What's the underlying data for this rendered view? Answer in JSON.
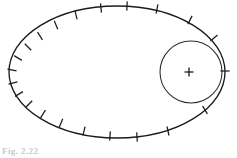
{
  "figure": {
    "background_color": "#ffffff",
    "stroke_color": "#1c1c1c",
    "caption_remnant": "Fig. 2.22",
    "width": 237,
    "height": 158
  },
  "chart_data": {
    "type": "scatter",
    "subtitle": "",
    "xlabel": "",
    "ylabel": "",
    "xlim": [
      0,
      237
    ],
    "ylim": [
      0,
      158
    ],
    "grid": false,
    "legend": "none",
    "annotations": [],
    "shapes": [
      {
        "name": "orbit-ellipse",
        "type": "ellipse",
        "cx": 117,
        "cy": 72,
        "rx": 108,
        "ry": 66,
        "stroke": "#1c1c1c",
        "stroke_width": 1.35,
        "fill": "none"
      },
      {
        "name": "inner-circle",
        "type": "circle",
        "cx": 191,
        "cy": 72,
        "r": 31,
        "stroke": "#2b2b2b",
        "stroke_width": 1.05,
        "fill": "none"
      }
    ],
    "center_markers": [
      {
        "name": "inner-circle-center",
        "x": 189,
        "y": 72,
        "size": 9
      }
    ],
    "series": [
      {
        "name": "position-ticks",
        "marker": "tick",
        "description": "Short cross strokes normal to the ellipse marking successive positions at equal time intervals; crowded near the far (left) side, sparse near the near (right) side.",
        "count": 22,
        "points": [
          {
            "index": 1,
            "x": 225,
            "y": 71,
            "angle_deg": 0
          },
          {
            "index": 2,
            "x": 214,
            "y": 38,
            "angle_deg": 27
          },
          {
            "index": 3,
            "x": 190,
            "y": 20,
            "angle_deg": 50
          },
          {
            "index": 4,
            "x": 157,
            "y": 9,
            "angle_deg": 72
          },
          {
            "index": 5,
            "x": 127,
            "y": 6,
            "angle_deg": 86
          },
          {
            "index": 6,
            "x": 101,
            "y": 8,
            "angle_deg": 99
          },
          {
            "index": 7,
            "x": 76,
            "y": 15,
            "angle_deg": 112
          },
          {
            "index": 8,
            "x": 56,
            "y": 25,
            "angle_deg": 124
          },
          {
            "index": 9,
            "x": 40,
            "y": 36,
            "angle_deg": 136
          },
          {
            "index": 10,
            "x": 28,
            "y": 47,
            "angle_deg": 148
          },
          {
            "index": 11,
            "x": 18,
            "y": 58,
            "angle_deg": 160
          },
          {
            "index": 12,
            "x": 12,
            "y": 70,
            "angle_deg": 174
          },
          {
            "index": 13,
            "x": 13,
            "y": 83,
            "angle_deg": 188
          },
          {
            "index": 14,
            "x": 19,
            "y": 94,
            "angle_deg": 200
          },
          {
            "index": 15,
            "x": 29,
            "y": 104,
            "angle_deg": 212
          },
          {
            "index": 16,
            "x": 43,
            "y": 114,
            "angle_deg": 224
          },
          {
            "index": 17,
            "x": 61,
            "y": 123,
            "angle_deg": 236
          },
          {
            "index": 18,
            "x": 84,
            "y": 131,
            "angle_deg": 249
          },
          {
            "index": 19,
            "x": 110,
            "y": 136,
            "angle_deg": 263
          },
          {
            "index": 20,
            "x": 137,
            "y": 137,
            "angle_deg": 276
          },
          {
            "index": 21,
            "x": 168,
            "y": 131,
            "angle_deg": 290
          },
          {
            "index": 22,
            "x": 205,
            "y": 110,
            "angle_deg": 315
          }
        ]
      }
    ]
  }
}
